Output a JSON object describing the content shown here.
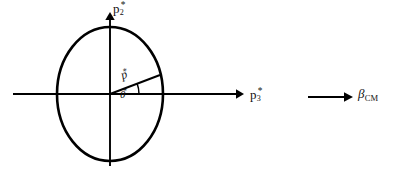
{
  "figure": {
    "background_color": "#ffffff",
    "stroke_color": "#000000"
  },
  "labels": {
    "vertical_axis": {
      "base": "p",
      "subscript": "2",
      "superscript": "*",
      "full_text": "p2*"
    },
    "horizontal_axis": {
      "base": "p",
      "subscript": "3",
      "superscript": "*",
      "full_text": "p3*"
    },
    "momentum_vector": {
      "base": "p",
      "superscript": "*",
      "full_text": "p*"
    },
    "scattering_angle": {
      "base": "θ",
      "superscript": "*",
      "full_text": "θ*"
    },
    "boost_velocity": {
      "base": "β",
      "subscript": "CM",
      "full_text": "βCM"
    }
  },
  "geometry": {
    "circle": {
      "center_x": 110,
      "center_y": 94,
      "radius_x": 53,
      "radius_y": 67,
      "stroke_width": 2.6
    },
    "horizontal_axis": {
      "x1": 13,
      "y1": 94,
      "x2": 243,
      "y2": 94,
      "arrow": "right"
    },
    "vertical_axis": {
      "x1": 110,
      "y1": 166,
      "x2": 110,
      "y2": 13,
      "arrow": "up"
    },
    "momentum_vector": {
      "x1": 110,
      "y1": 94,
      "x2": 160,
      "y2": 75,
      "angle_degrees": 21
    },
    "angle_arc": {
      "center_x": 110,
      "center_y": 94,
      "radius": 29,
      "start_degrees": 0,
      "end_degrees": 21
    },
    "boost_arrow": {
      "x1": 308,
      "y1": 97,
      "x2": 352,
      "y2": 97,
      "arrow": "right"
    }
  }
}
